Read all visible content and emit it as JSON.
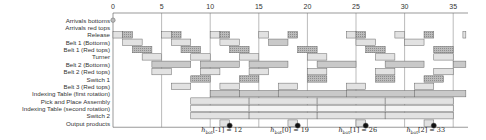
{
  "chart_data": {
    "type": "gantt",
    "title": "",
    "x_axis": {
      "min": 0,
      "max": 36,
      "ticks": [
        0,
        5,
        10,
        15,
        20,
        25,
        30,
        35
      ]
    },
    "rows": [
      "Arrivals bottoms",
      "Arrivals red tops",
      "Release",
      "Belt 1 (Bottoms)",
      "Belt 1 (Red tops)",
      "Turner",
      "Belt 2 (Bottoms)",
      "Belt 2 (Red tops)",
      "Switch 1",
      "Belt 3 (Red tops)",
      "Indexing Table (first rotation)",
      "Pick and Place Assembly",
      "Indexing Table (second rotation)",
      "Switch 2",
      "Output products"
    ],
    "bars": [
      {
        "row": 2,
        "start": 0,
        "end": 1,
        "shade": "light"
      },
      {
        "row": 2,
        "start": 1,
        "end": 2,
        "shade": "dark"
      },
      {
        "row": 2,
        "start": 5,
        "end": 6,
        "shade": "light"
      },
      {
        "row": 2,
        "start": 6,
        "end": 7,
        "shade": "dark"
      },
      {
        "row": 2,
        "start": 10,
        "end": 11,
        "shade": "light"
      },
      {
        "row": 2,
        "start": 11,
        "end": 12,
        "shade": "dark"
      },
      {
        "row": 2,
        "start": 15,
        "end": 16,
        "shade": "light"
      },
      {
        "row": 2,
        "start": 18,
        "end": 19,
        "shade": "dark"
      },
      {
        "row": 2,
        "start": 24,
        "end": 25,
        "shade": "light"
      },
      {
        "row": 2,
        "start": 25,
        "end": 26,
        "shade": "dark"
      },
      {
        "row": 2,
        "start": 29,
        "end": 30,
        "shade": "light"
      },
      {
        "row": 2,
        "start": 32,
        "end": 33,
        "shade": "dark"
      },
      {
        "row": 2,
        "start": 36,
        "end": 36.3,
        "shade": "light"
      },
      {
        "row": 3,
        "start": 1,
        "end": 3,
        "shade": "light"
      },
      {
        "row": 3,
        "start": 6,
        "end": 8,
        "shade": "light"
      },
      {
        "row": 3,
        "start": 11,
        "end": 13,
        "shade": "light"
      },
      {
        "row": 3,
        "start": 16,
        "end": 18,
        "shade": "medium"
      },
      {
        "row": 3,
        "start": 25,
        "end": 27,
        "shade": "light"
      },
      {
        "row": 3,
        "start": 30,
        "end": 32,
        "shade": "light"
      },
      {
        "row": 4,
        "start": 2,
        "end": 4,
        "shade": "dark"
      },
      {
        "row": 4,
        "start": 7,
        "end": 9,
        "shade": "dark"
      },
      {
        "row": 4,
        "start": 12,
        "end": 14,
        "shade": "dark"
      },
      {
        "row": 4,
        "start": 19,
        "end": 21,
        "shade": "dark"
      },
      {
        "row": 4,
        "start": 26,
        "end": 28,
        "shade": "dark"
      },
      {
        "row": 4,
        "start": 33,
        "end": 35,
        "shade": "dark"
      },
      {
        "row": 5,
        "start": 3,
        "end": 5,
        "shade": "light"
      },
      {
        "row": 5,
        "start": 8,
        "end": 10,
        "shade": "light"
      },
      {
        "row": 5,
        "start": 13,
        "end": 15,
        "shade": "light"
      },
      {
        "row": 5,
        "start": 20,
        "end": 22,
        "shade": "light"
      },
      {
        "row": 5,
        "start": 27,
        "end": 29,
        "shade": "light"
      },
      {
        "row": 5,
        "start": 33,
        "end": 35,
        "shade": "light"
      },
      {
        "row": 6,
        "start": 4,
        "end": 8,
        "shade": "medium"
      },
      {
        "row": 6,
        "start": 9,
        "end": 13,
        "shade": "medium"
      },
      {
        "row": 6,
        "start": 14,
        "end": 18,
        "shade": "medium"
      },
      {
        "row": 6,
        "start": 21,
        "end": 25,
        "shade": "medium"
      },
      {
        "row": 6,
        "start": 28,
        "end": 32,
        "shade": "medium"
      },
      {
        "row": 6,
        "start": 35,
        "end": 36.3,
        "shade": "medium"
      },
      {
        "row": 7,
        "start": 4,
        "end": 6,
        "shade": "light"
      },
      {
        "row": 7,
        "start": 9,
        "end": 11,
        "shade": "light"
      },
      {
        "row": 7,
        "start": 14,
        "end": 16,
        "shade": "light"
      },
      {
        "row": 7,
        "start": 20,
        "end": 22,
        "shade": "light"
      },
      {
        "row": 7,
        "start": 27,
        "end": 29,
        "shade": "light"
      },
      {
        "row": 7,
        "start": 33,
        "end": 35,
        "shade": "light"
      },
      {
        "row": 8,
        "start": 8,
        "end": 10,
        "shade": "dark"
      },
      {
        "row": 8,
        "start": 13,
        "end": 15,
        "shade": "dark"
      },
      {
        "row": 8,
        "start": 20,
        "end": 22,
        "shade": "dark"
      },
      {
        "row": 8,
        "start": 27,
        "end": 29,
        "shade": "dark"
      },
      {
        "row": 8,
        "start": 32,
        "end": 34,
        "shade": "dark"
      },
      {
        "row": 9,
        "start": 6,
        "end": 8,
        "shade": "light"
      },
      {
        "row": 9,
        "start": 11,
        "end": 13,
        "shade": "light"
      },
      {
        "row": 9,
        "start": 17,
        "end": 19,
        "shade": "light"
      },
      {
        "row": 9,
        "start": 24,
        "end": 26,
        "shade": "light"
      },
      {
        "row": 9,
        "start": 31,
        "end": 33,
        "shade": "light"
      },
      {
        "row": 10,
        "start": 10,
        "end": 13,
        "shade": "medium"
      },
      {
        "row": 10,
        "start": 13,
        "end": 17,
        "shade": "medium"
      },
      {
        "row": 10,
        "start": 17,
        "end": 24,
        "shade": "medium"
      },
      {
        "row": 10,
        "start": 24,
        "end": 31,
        "shade": "medium"
      },
      {
        "row": 10,
        "start": 31,
        "end": 36.3,
        "shade": "medium"
      },
      {
        "row": 11,
        "start": 8,
        "end": 14,
        "shade": "light"
      },
      {
        "row": 11,
        "start": 14,
        "end": 21,
        "shade": "light"
      },
      {
        "row": 11,
        "start": 21,
        "end": 28,
        "shade": "light"
      },
      {
        "row": 11,
        "start": 28,
        "end": 35,
        "shade": "light"
      },
      {
        "row": 12,
        "start": 8,
        "end": 14,
        "shade": "white"
      },
      {
        "row": 12,
        "start": 14,
        "end": 21,
        "shade": "white"
      },
      {
        "row": 12,
        "start": 21,
        "end": 28,
        "shade": "white"
      },
      {
        "row": 12,
        "start": 28,
        "end": 35,
        "shade": "white"
      },
      {
        "row": 13,
        "start": 8,
        "end": 14,
        "shade": "light"
      },
      {
        "row": 13,
        "start": 14,
        "end": 21,
        "shade": "light"
      },
      {
        "row": 13,
        "start": 21,
        "end": 28,
        "shade": "light"
      },
      {
        "row": 13,
        "start": 28,
        "end": 35,
        "shade": "light"
      },
      {
        "row": 14,
        "start": 11,
        "end": 12,
        "shade": "light"
      },
      {
        "row": 14,
        "start": 18,
        "end": 19,
        "shade": "light"
      },
      {
        "row": 14,
        "start": 25,
        "end": 26,
        "shade": "light"
      },
      {
        "row": 14,
        "start": 32,
        "end": 33,
        "shade": "light"
      }
    ],
    "markers": [
      {
        "row": 0,
        "t": 0,
        "type": "hollow"
      },
      {
        "row": 14,
        "t": 12,
        "type": "filled"
      },
      {
        "row": 14,
        "t": 19,
        "type": "filled"
      },
      {
        "row": 14,
        "t": 26,
        "type": "filled"
      },
      {
        "row": 14,
        "t": 33,
        "type": "filled"
      }
    ],
    "annotations": [
      {
        "t": 12,
        "label": "h_bot[-1] = 12"
      },
      {
        "t": 19,
        "label": "h_bot[0] = 19"
      },
      {
        "t": 26,
        "label": "h_bot[1] = 26"
      },
      {
        "t": 33,
        "label": "h_bot[2] = 33"
      }
    ],
    "vlines": [
      5,
      10,
      15,
      20,
      25,
      30,
      35
    ]
  },
  "colors": {
    "light": "#e2e2e2",
    "medium": "#c9c9c9",
    "dark": "#a9a9a9",
    "white": "#f4f4f4",
    "border": "#666666",
    "axis": "#555555"
  }
}
